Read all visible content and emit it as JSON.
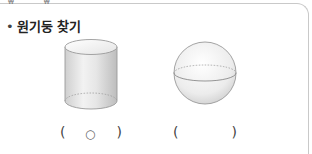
{
  "header": {
    "crop_marks": "₩ ₩"
  },
  "question": {
    "bullet": "•",
    "title": "원기둥 찾기"
  },
  "shapes": [
    {
      "name": "cylinder",
      "answer_mark": "○"
    },
    {
      "name": "sphere",
      "answer_mark": ""
    }
  ],
  "parens": {
    "open": "(",
    "close": ")"
  },
  "colors": {
    "border": "#c9c9c9",
    "shape_stroke": "#9a9a9a",
    "shape_fill_light": "#f4f4f4",
    "shape_fill_dark": "#d2d2d2",
    "text": "#222222"
  }
}
